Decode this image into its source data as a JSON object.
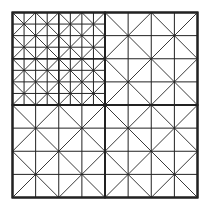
{
  "diagram": {
    "type": "recursive square subdivision tiling",
    "background": "#ffffff",
    "stroke": "#222222",
    "outer_square": {
      "x": 12.5,
      "y": 12.5,
      "size": 185
    },
    "quadrants": [
      {
        "name": "top-left",
        "subdivided": true
      },
      {
        "name": "top-right",
        "subdivided": false
      },
      {
        "name": "bottom-left",
        "subdivided": false
      },
      {
        "name": "bottom-right",
        "subdivided": false
      }
    ],
    "tile_pattern": "4x4 grid with both diagonals in each 2x2 block"
  }
}
